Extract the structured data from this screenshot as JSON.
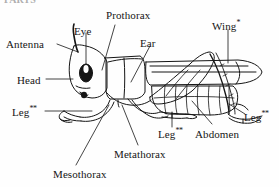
{
  "figure": {
    "cut_off_heading": "PARTS",
    "background_color": "#fefefe",
    "ink_color": "#151515"
  },
  "labels": [
    {
      "id": "antenna",
      "text": "Antenna",
      "marker": ""
    },
    {
      "id": "eye",
      "text": "Eye",
      "marker": ""
    },
    {
      "id": "prothorax",
      "text": "Prothorax",
      "marker": ""
    },
    {
      "id": "ear",
      "text": "Ear",
      "marker": ""
    },
    {
      "id": "wing",
      "text": "Wing",
      "marker": "*"
    },
    {
      "id": "head",
      "text": "Head",
      "marker": ""
    },
    {
      "id": "leg-front",
      "text": "Leg",
      "marker": "**"
    },
    {
      "id": "leg-middle",
      "text": "Leg",
      "marker": "**"
    },
    {
      "id": "leg-hind",
      "text": "Leg",
      "marker": "**"
    },
    {
      "id": "abdomen",
      "text": "Abdomen",
      "marker": ""
    },
    {
      "id": "metathorax",
      "text": "Metathorax",
      "marker": ""
    },
    {
      "id": "mesothorax",
      "text": "Mesothorax",
      "marker": ""
    }
  ]
}
